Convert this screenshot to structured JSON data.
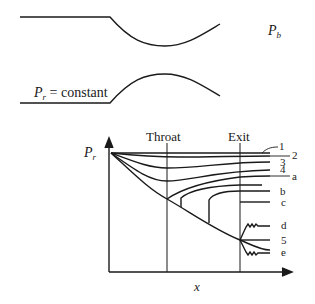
{
  "nozzle": {
    "reservoir_label_symbol": "P",
    "reservoir_label_sub": "r",
    "reservoir_label_suffix": " = constant",
    "back_pressure_symbol": "P",
    "back_pressure_sub": "b"
  },
  "plot": {
    "throat_label": "Throat",
    "exit_label": "Exit",
    "y_axis_symbol": "P",
    "y_axis_sub": "r",
    "x_axis_label": "x",
    "curve_labels": [
      "1",
      "2",
      "3",
      "4",
      "a",
      "b",
      "c",
      "d",
      "5",
      "e"
    ]
  },
  "colors": {
    "line": "#1a1a1a",
    "background": "#ffffff"
  }
}
